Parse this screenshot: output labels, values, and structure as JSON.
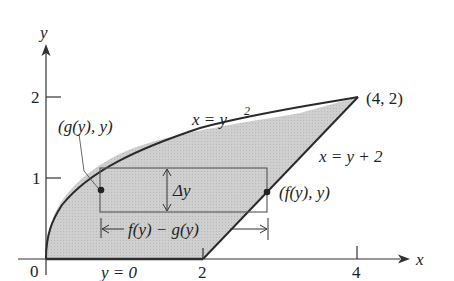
{
  "diagram": {
    "axes": {
      "x_label": "x",
      "y_label": "y",
      "x_ticks": [
        "0",
        "2",
        "4"
      ],
      "y_ticks": [
        "1",
        "2"
      ]
    },
    "curves": {
      "parabola_label": "x = y",
      "parabola_exp": "2",
      "line_label": "x = y + 2",
      "bottom_label": "y = 0"
    },
    "points": {
      "corner": "(4, 2)",
      "left_point": "(g(y), y)",
      "right_point": "(f(y), y)"
    },
    "strip": {
      "height_label": "Δy",
      "width_label": "f(y) − g(y)"
    },
    "colors": {
      "region_fill": "#c8c8c8",
      "stroke": "#2a2a2a",
      "thin": "#555555"
    }
  }
}
